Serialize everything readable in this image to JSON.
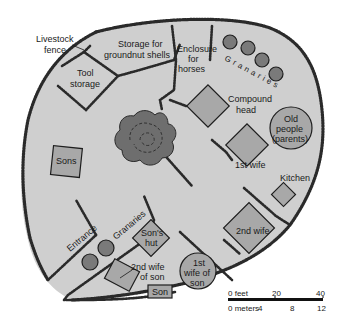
{
  "diagram": {
    "type": "compound-plan",
    "colors": {
      "ground": "#cfcfcf",
      "hut_fill": "#a8a8a8",
      "granary_fill": "#7a7a7a",
      "tree_fill": "#6e6e6e",
      "fence": "#2a2a2a",
      "background": "#ffffff"
    },
    "labels": {
      "livestock_fence": [
        "Livestock",
        "fence"
      ],
      "storage_groundnut": [
        "Storage for",
        "groundnut shells"
      ],
      "tool_storage": [
        "Tool",
        "storage"
      ],
      "enclosure_horses": [
        "Enclosure",
        "for",
        "horses"
      ],
      "granaries_top": "Granaries",
      "compound_head": [
        "Compound",
        "head"
      ],
      "old_people": [
        "Old",
        "people",
        "(parents)"
      ],
      "sons": "Sons",
      "first_wife": "1st wife",
      "kitchen": "Kitchen",
      "second_wife": "2nd wife",
      "entrance": "Entrance",
      "granaries_bottom": "Granaries",
      "sons_hut": [
        "Son's",
        "hut"
      ],
      "second_wife_of_son": [
        "2nd wife",
        "of son"
      ],
      "first_wife_of_son": [
        "1st",
        "wife of",
        "son"
      ],
      "son": "Son"
    },
    "scale_bar": {
      "feet_label": "0 feet",
      "feet_ticks": [
        "20",
        "40"
      ],
      "meters_label": "0 meters",
      "meters_ticks": [
        "4",
        "8",
        "12"
      ]
    }
  }
}
